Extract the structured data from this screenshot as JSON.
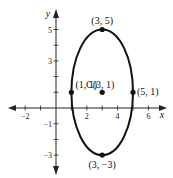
{
  "diagram": {
    "type": "ellipse-graph",
    "axes": {
      "x_label": "x",
      "y_label": "y",
      "x_range": [
        -3,
        7
      ],
      "y_range": [
        -4,
        6
      ],
      "x_ticks": [
        -2,
        -1,
        1,
        2,
        3,
        4,
        5,
        6
      ],
      "x_tick_labels": [
        {
          "value": -2,
          "text": "−2"
        },
        {
          "value": 2,
          "text": "2"
        },
        {
          "value": 4,
          "text": "4"
        },
        {
          "value": 6,
          "text": "6"
        }
      ],
      "y_ticks": [
        -3,
        -2,
        -1,
        1,
        2,
        3,
        4,
        5
      ],
      "y_tick_labels": [
        {
          "value": 5,
          "text": "5"
        },
        {
          "value": 3,
          "text": "3"
        },
        {
          "value": -1,
          "text": "−1"
        },
        {
          "value": -3,
          "text": "−3"
        }
      ]
    },
    "ellipse": {
      "center": [
        3,
        1
      ],
      "semi_axis_x": 2,
      "semi_axis_y": 4,
      "color": "#111111"
    },
    "points": [
      {
        "name": "top-vertex",
        "x": 3,
        "y": 5,
        "label": "(3, 5)"
      },
      {
        "name": "bottom-vertex",
        "x": 3,
        "y": -3,
        "label": "(3, −3)"
      },
      {
        "name": "left-covertex",
        "x": 1,
        "y": 1,
        "label": "(1, 1)"
      },
      {
        "name": "right-covertex",
        "x": 5,
        "y": 1,
        "label": "(5, 1)"
      },
      {
        "name": "center",
        "x": 3,
        "y": 1,
        "label": "C(3, 1)"
      }
    ]
  }
}
